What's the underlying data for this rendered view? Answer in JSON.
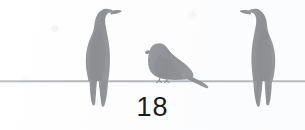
{
  "page": {
    "number": "18",
    "background_color": "#fefeff",
    "width": 305,
    "height": 130
  },
  "illustration": {
    "title": "Three birds perched on a wire",
    "silhouette_color": "#909295",
    "silhouette_color_light": "#9a9c9f",
    "wire": {
      "color": "#a9abae",
      "y": 81,
      "thickness": 1.4,
      "span": "full-width"
    },
    "birds": [
      {
        "name": "bird-left",
        "facing": "right",
        "size": "large",
        "x": 78,
        "y": 8,
        "perched": true
      },
      {
        "name": "bird-middle",
        "facing": "left",
        "size": "small",
        "x": 146,
        "y": 43,
        "perched": true
      },
      {
        "name": "bird-right",
        "facing": "left",
        "size": "large",
        "x": 232,
        "y": 8,
        "perched": true
      }
    ]
  }
}
